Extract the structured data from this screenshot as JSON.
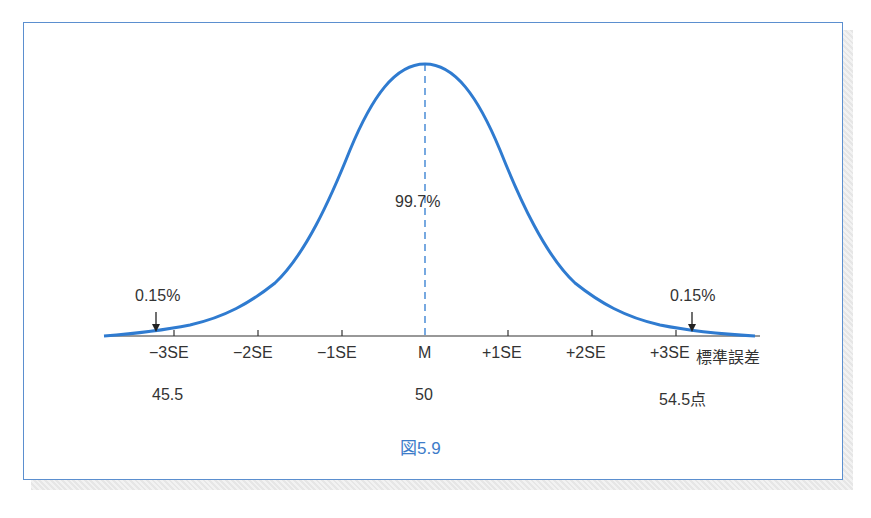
{
  "figure": {
    "caption": "図5.9",
    "center_label": "99.7%",
    "left_tail_label": "0.15%",
    "right_tail_label": "0.15%",
    "axis_unit_label": "標準誤差",
    "ticks": [
      "−3SE",
      "−2SE",
      "−1SE",
      "M",
      "+1SE",
      "+2SE",
      "+3SE"
    ],
    "scores": {
      "left": "45.5",
      "center": "50",
      "right": "54.5点"
    },
    "colors": {
      "curve": "#2f7bd0",
      "frame": "#5b8fcf",
      "caption": "#3d7cc9"
    }
  }
}
